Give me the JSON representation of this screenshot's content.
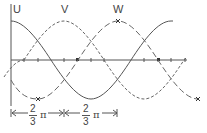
{
  "diagram": {
    "type": "three-phase sinusoidal waveform",
    "labels": {
      "u": "U",
      "v": "V",
      "w": "W"
    },
    "waves": [
      {
        "name": "U",
        "style": "solid",
        "phase_shift": "0"
      },
      {
        "name": "V",
        "style": "short-dashed",
        "phase_shift": "2/3 π"
      },
      {
        "name": "W",
        "style": "long-dashed",
        "phase_shift": "4/3 π"
      }
    ],
    "dimensions": [
      {
        "numerator": "2",
        "denominator": "3",
        "symbol": "π"
      },
      {
        "numerator": "2",
        "denominator": "3",
        "symbol": "π"
      }
    ],
    "colors": {
      "line": "#555555",
      "text": "#444444",
      "background": "#ffffff"
    }
  }
}
